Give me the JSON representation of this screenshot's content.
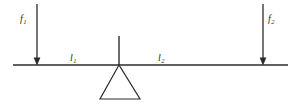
{
  "diagram": {
    "type": "lever-free-body-diagram",
    "background_color": "#ffffff",
    "stroke_color": "#2b2b2b",
    "labels": {
      "force_left": {
        "symbol": "f",
        "subscript": "1",
        "full": "f1"
      },
      "force_right": {
        "symbol": "f",
        "subscript": "2",
        "full": "f2"
      },
      "arm_left": {
        "symbol": "l",
        "subscript": "1",
        "full": "l1"
      },
      "arm_right": {
        "symbol": "l",
        "subscript": "2",
        "full": "l2"
      }
    },
    "geometry": {
      "beam": {
        "x1": 13,
        "y1": 65,
        "x2": 288,
        "y2": 65
      },
      "fulcrum_apex_x": 119,
      "fulcrum_base_y": 99,
      "fulcrum_base_left_x": 100,
      "fulcrum_base_right_x": 140,
      "fulcrum_post_top_y": 36,
      "arrow_left_x": 37,
      "arrow_right_x": 263,
      "arrow_top_y": 4
    }
  }
}
